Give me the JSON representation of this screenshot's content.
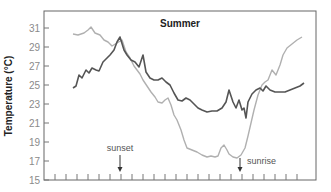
{
  "chart_data": {
    "type": "line",
    "title": "Summer",
    "xlabel": "",
    "ylabel": "Temperature (°C)",
    "ylim": [
      15,
      32
    ],
    "yticks": [
      15,
      17,
      19,
      21,
      23,
      25,
      27,
      29,
      31
    ],
    "x_tick_count": 23,
    "x_tick_labels": [],
    "grid": false,
    "legend": null,
    "annotations": [
      {
        "text": "sunset",
        "x_px": 120,
        "arrow": "down"
      },
      {
        "text": "sunrise",
        "x_px": 240,
        "arrow": "down"
      }
    ],
    "pixel_mapping": {
      "y_top_px": 28,
      "y_top_value": 31,
      "y_bottom_px": 180,
      "y_bottom_value": 15,
      "px_per_degree": 9.5
    },
    "series": [
      {
        "name": "dark series",
        "color": "#555555",
        "points_px": [
          [
            73,
            88
          ],
          [
            76,
            86
          ],
          [
            79,
            75
          ],
          [
            82,
            78
          ],
          [
            86,
            70
          ],
          [
            89,
            73
          ],
          [
            92,
            68
          ],
          [
            96,
            70
          ],
          [
            99,
            71
          ],
          [
            103,
            62
          ],
          [
            107,
            58
          ],
          [
            110,
            55
          ],
          [
            114,
            50
          ],
          [
            117,
            42
          ],
          [
            120,
            37
          ],
          [
            124,
            50
          ],
          [
            127,
            55
          ],
          [
            131,
            60
          ],
          [
            135,
            62
          ],
          [
            139,
            67
          ],
          [
            143,
            55
          ],
          [
            146,
            72
          ],
          [
            150,
            78
          ],
          [
            154,
            80
          ],
          [
            158,
            80
          ],
          [
            162,
            78
          ],
          [
            166,
            82
          ],
          [
            170,
            85
          ],
          [
            174,
            93
          ],
          [
            178,
            100
          ],
          [
            182,
            101
          ],
          [
            186,
            98
          ],
          [
            190,
            100
          ],
          [
            194,
            104
          ],
          [
            198,
            108
          ],
          [
            202,
            110
          ],
          [
            207,
            112
          ],
          [
            212,
            111
          ],
          [
            217,
            111
          ],
          [
            222,
            108
          ],
          [
            226,
            102
          ],
          [
            229,
            90
          ],
          [
            233,
            102
          ],
          [
            236,
            108
          ],
          [
            239,
            100
          ],
          [
            242,
            110
          ],
          [
            244,
            108
          ],
          [
            246,
            118
          ],
          [
            248,
            102
          ],
          [
            252,
            94
          ],
          [
            256,
            90
          ],
          [
            260,
            88
          ],
          [
            263,
            91
          ],
          [
            266,
            86
          ],
          [
            270,
            90
          ],
          [
            275,
            92
          ],
          [
            280,
            92
          ],
          [
            285,
            92
          ],
          [
            290,
            90
          ],
          [
            295,
            88
          ],
          [
            300,
            86
          ],
          [
            304,
            83
          ]
        ],
        "values_approx_c": [
          24.7,
          24.9,
          26.1,
          25.7,
          26.6,
          26.3,
          26.8,
          26.6,
          26.5,
          27.4,
          27.9,
          28.2,
          28.7,
          29.5,
          30.1,
          28.7,
          28.2,
          27.6,
          27.4,
          26.9,
          28.2,
          26.4,
          25.7,
          25.5,
          25.5,
          25.7,
          25.3,
          25.0,
          24.2,
          23.4,
          23.3,
          23.6,
          23.4,
          23.0,
          22.6,
          22.4,
          22.2,
          22.3,
          22.3,
          22.6,
          23.2,
          24.5,
          23.2,
          22.6,
          23.4,
          22.4,
          22.6,
          21.5,
          23.2,
          24.1,
          24.5,
          24.7,
          24.4,
          24.9,
          24.5,
          24.3,
          24.3,
          24.3,
          24.5,
          24.7,
          24.9,
          25.2
        ]
      },
      {
        "name": "light series",
        "color": "#b0b0b0",
        "points_px": [
          [
            73,
            34
          ],
          [
            78,
            35
          ],
          [
            84,
            33
          ],
          [
            88,
            30
          ],
          [
            91,
            27
          ],
          [
            95,
            33
          ],
          [
            100,
            35
          ],
          [
            104,
            40
          ],
          [
            108,
            42
          ],
          [
            112,
            46
          ],
          [
            117,
            43
          ],
          [
            122,
            40
          ],
          [
            126,
            52
          ],
          [
            130,
            58
          ],
          [
            134,
            66
          ],
          [
            137,
            70
          ],
          [
            140,
            74
          ],
          [
            143,
            80
          ],
          [
            147,
            86
          ],
          [
            151,
            92
          ],
          [
            155,
            97
          ],
          [
            158,
            102
          ],
          [
            162,
            103
          ],
          [
            165,
            100
          ],
          [
            168,
            98
          ],
          [
            171,
            105
          ],
          [
            174,
            115
          ],
          [
            177,
            120
          ],
          [
            181,
            130
          ],
          [
            184,
            140
          ],
          [
            187,
            148
          ],
          [
            192,
            150
          ],
          [
            197,
            152
          ],
          [
            202,
            155
          ],
          [
            207,
            157
          ],
          [
            211,
            156
          ],
          [
            215,
            157
          ],
          [
            218,
            156
          ],
          [
            221,
            148
          ],
          [
            224,
            145
          ],
          [
            227,
            150
          ],
          [
            229,
            154
          ],
          [
            233,
            157
          ],
          [
            237,
            158
          ],
          [
            241,
            155
          ],
          [
            245,
            148
          ],
          [
            248,
            136
          ],
          [
            251,
            123
          ],
          [
            254,
            110
          ],
          [
            258,
            95
          ],
          [
            262,
            85
          ],
          [
            265,
            82
          ],
          [
            268,
            80
          ],
          [
            272,
            70
          ],
          [
            276,
            75
          ],
          [
            280,
            65
          ],
          [
            283,
            55
          ],
          [
            287,
            48
          ],
          [
            292,
            44
          ],
          [
            297,
            40
          ],
          [
            302,
            37
          ]
        ],
        "values_approx_c": [
          30.4,
          30.3,
          30.5,
          30.8,
          31.1,
          30.5,
          30.3,
          29.7,
          29.5,
          29.1,
          29.4,
          29.7,
          28.5,
          27.8,
          27.0,
          26.6,
          26.2,
          25.5,
          24.9,
          24.3,
          23.7,
          23.2,
          23.1,
          23.4,
          23.6,
          22.9,
          21.8,
          21.3,
          20.3,
          19.2,
          18.4,
          18.2,
          17.9,
          17.6,
          17.4,
          17.5,
          17.4,
          17.5,
          18.4,
          18.7,
          18.2,
          17.7,
          17.4,
          17.3,
          17.6,
          18.4,
          19.6,
          21.0,
          22.4,
          23.9,
          25.0,
          25.3,
          25.5,
          26.6,
          26.1,
          27.1,
          28.2,
          28.9,
          29.3,
          29.7,
          30.1
        ]
      }
    ]
  }
}
